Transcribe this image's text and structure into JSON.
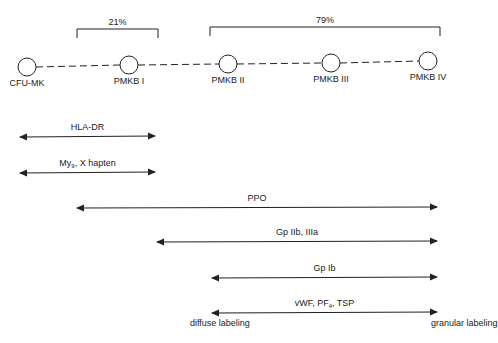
{
  "stages": [
    {
      "label": "CFU-MK",
      "x": 27,
      "y": 67
    },
    {
      "label": "PMKB I",
      "x": 129,
      "y": 65
    },
    {
      "label": "PMKB II",
      "x": 228,
      "y": 64
    },
    {
      "label": "PMKB III",
      "x": 331,
      "y": 63
    },
    {
      "label": "PMKB IV",
      "x": 428,
      "y": 61
    }
  ],
  "brackets": [
    {
      "label": "21%",
      "x1": 77,
      "x2": 158,
      "y": 29
    },
    {
      "label": "79%",
      "x1": 210,
      "x2": 440,
      "y": 27
    }
  ],
  "markers": [
    {
      "label": "HLA-DR",
      "x1": 20,
      "x2": 155,
      "y": 137
    },
    {
      "label_main": "My",
      "label_sub": "9",
      "label_rest": ", X hapten",
      "x1": 20,
      "x2": 155,
      "y": 173
    },
    {
      "label": "PPO",
      "x1": 77,
      "x2": 437,
      "y": 208
    },
    {
      "label": "Gp IIb, IIIa",
      "x1": 157,
      "x2": 437,
      "y": 242
    },
    {
      "label": "Gp Ib",
      "x1": 212,
      "x2": 437,
      "y": 278
    },
    {
      "label_main": "vWF, PF",
      "label_sub": "4",
      "label_rest": ", TSP",
      "x1": 212,
      "x2": 437,
      "y": 313
    }
  ],
  "end_labels": {
    "left": "diffuse labeling",
    "right": "granular labeling"
  },
  "colors": {
    "line": "#222222",
    "background": "#ffffff"
  }
}
